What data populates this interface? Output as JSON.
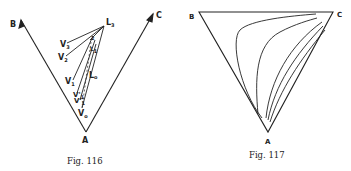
{
  "figures": [
    {
      "caption": "Fig. 116",
      "vertices": {
        "A": "A",
        "B": "B",
        "C": "C"
      },
      "points": {
        "L3": {
          "main": "L",
          "sub": "3"
        },
        "L2": {
          "main": "L",
          "sub": "2"
        },
        "L1": {
          "main": "L",
          "sub": "1"
        },
        "L0": {
          "main": "L",
          "sub": "o"
        },
        "V3": {
          "main": "V",
          "sub": "3"
        },
        "V2": {
          "main": "V",
          "sub": "2"
        },
        "V1": {
          "main": "V",
          "sub": "1"
        },
        "V1p": {
          "main": "V'",
          "sub": "1"
        },
        "V1pp": {
          "main": "V'",
          "sub": "1"
        },
        "V0": {
          "main": "V",
          "sub": "o"
        }
      }
    },
    {
      "caption": "Fig. 117",
      "vertices": {
        "A": "A",
        "B": "B",
        "C": "C"
      }
    }
  ]
}
